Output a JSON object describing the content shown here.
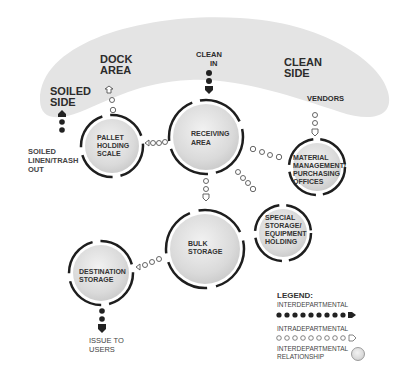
{
  "zones": {
    "soiled_side": [
      "SOILED",
      "SIDE"
    ],
    "dock_area": [
      "DOCK",
      "AREA"
    ],
    "clean_side": [
      "CLEAN",
      "SIDE"
    ]
  },
  "external_labels": {
    "clean_in": [
      "CLEAN",
      "IN"
    ],
    "vendors": "VENDORS",
    "soiled_out": [
      "SOILED",
      "LINEN/TRASH",
      "OUT"
    ],
    "issue_to_users": [
      "ISSUE  TO",
      "USERS"
    ]
  },
  "nodes": {
    "receiving": [
      "RECEIVING",
      "AREA"
    ],
    "pallet": [
      "PALLET",
      "HOLDING",
      "SCALE"
    ],
    "material": [
      "MATERIAL",
      "MANAGEMENT/",
      "PURCHASING",
      "OFFICES"
    ],
    "special": [
      "SPECIAL",
      "STORAGE/",
      "EQUIPMENT",
      "HOLDING"
    ],
    "bulk": [
      "BULK",
      "STORAGE"
    ],
    "destination": [
      "DESTINATION",
      "STORAGE"
    ]
  },
  "legend": {
    "title": "LEGEND:",
    "interdepartmental_flow": "INTERDEPARTMENTAL",
    "intradepartmental_flow": "INTRADEPARTMENTAL",
    "relationship": [
      "INTERDEPARTMENTAL",
      "RELATIONSHIP"
    ]
  },
  "colors": {
    "band": "#e4e4e4",
    "node_fill": "#dcdcdc",
    "ring": "#1e1e1e",
    "dot": "#222222"
  }
}
